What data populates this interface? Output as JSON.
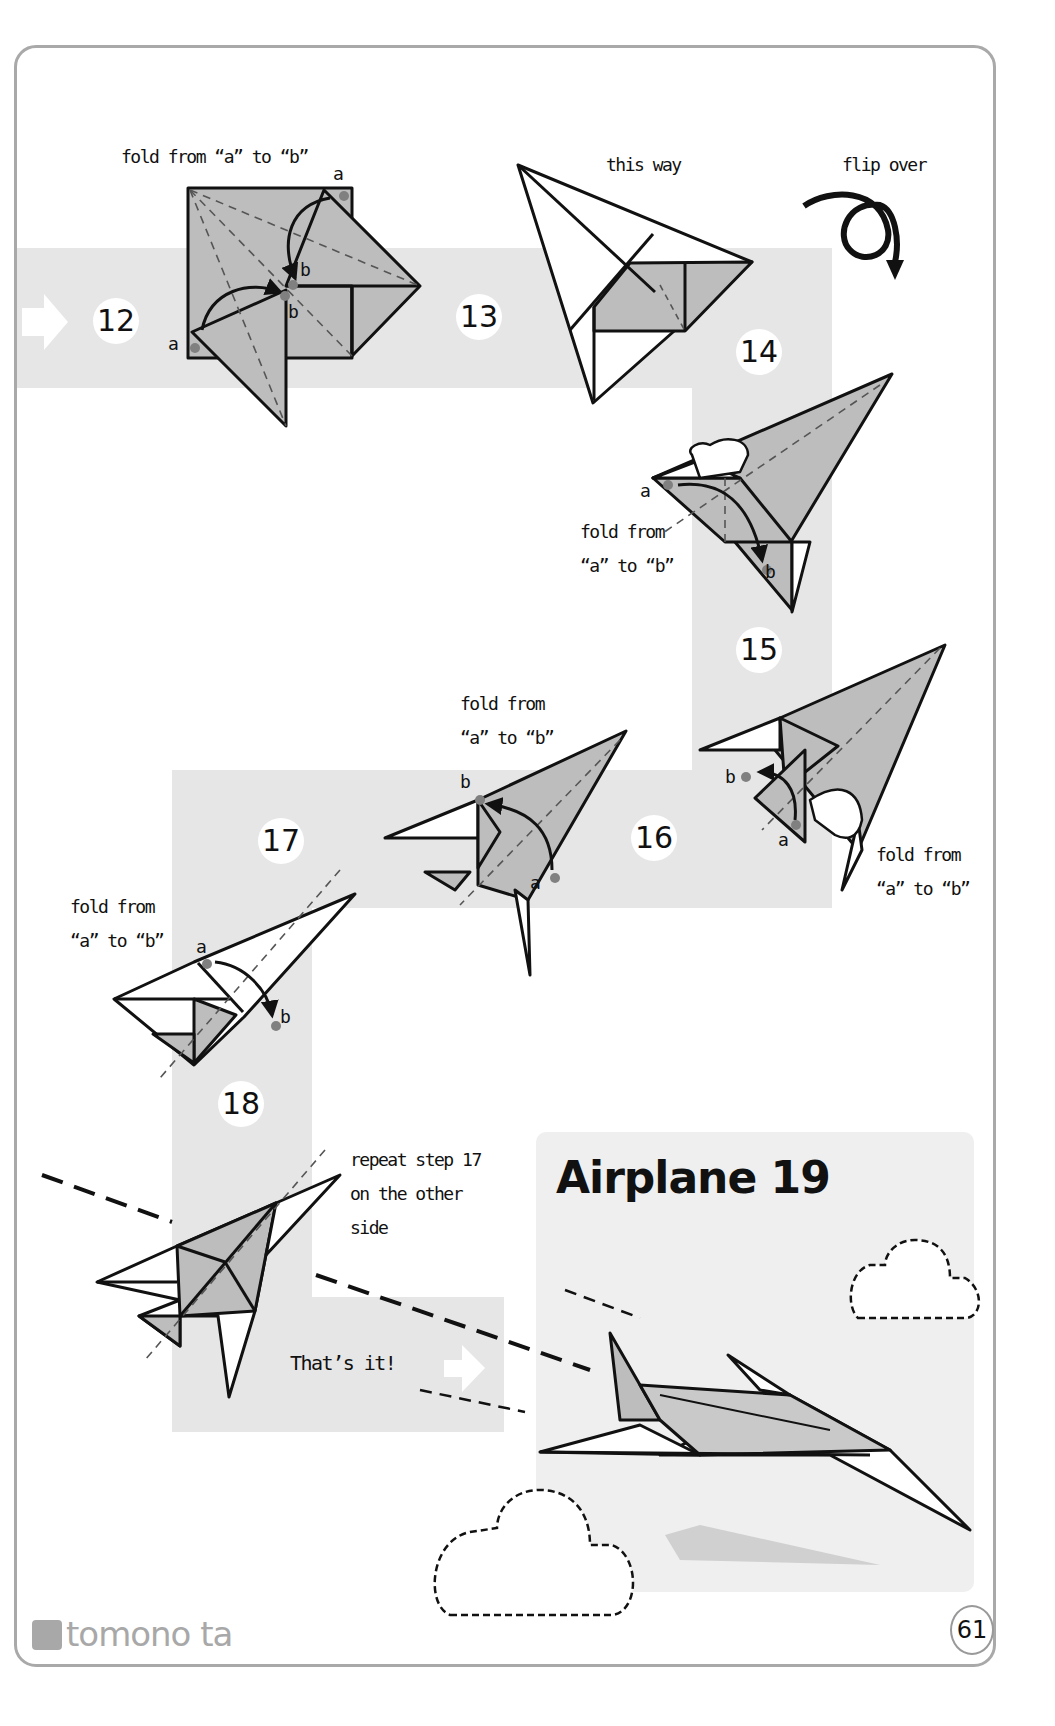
{
  "page": {
    "title": "Airplane 19",
    "page_number": "61",
    "publisher_logo": "tomono ta",
    "colors": {
      "band_gray": "#e6e6e6",
      "paper_gray": "#bdbdbd",
      "outline": "#111111",
      "dot": "#808080",
      "border": "#a9a9a9"
    }
  },
  "steps": [
    {
      "number": "12",
      "label": "fold from “a” to “b”",
      "points": [
        "a",
        "a",
        "b",
        "b"
      ]
    },
    {
      "number": "13",
      "label": "this way"
    },
    {
      "number": "14",
      "label_line1": "fold from",
      "label_line2": "“a” to “b”",
      "points": [
        "a",
        "b"
      ]
    },
    {
      "number": "15",
      "label_line1": "fold from",
      "label_line2": "“a” to “b”",
      "points": [
        "a",
        "b"
      ]
    },
    {
      "number": "16",
      "label_line1": "fold from",
      "label_line2": "“a” to “b”",
      "points": [
        "a",
        "b"
      ]
    },
    {
      "number": "17",
      "label_line1": "fold from",
      "label_line2": "“a” to “b”",
      "points": [
        "a",
        "b"
      ]
    },
    {
      "number": "18",
      "label_line1": "repeat step 17",
      "label_line2": "on the other",
      "label_line3": "side"
    }
  ],
  "flip": {
    "label": "flip over",
    "icon": "flip-over-arrow-icon"
  },
  "finish": {
    "label": "That’s it!",
    "icon": "right-arrow-icon"
  },
  "start_arrow": {
    "icon": "right-arrow-icon"
  },
  "point_labels": {
    "a": "a",
    "b": "b"
  }
}
